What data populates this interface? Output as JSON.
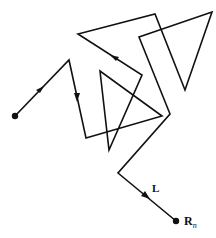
{
  "diagram": {
    "stroke_color": "#111111",
    "labels": {
      "segment_label": "L",
      "end_label": "R",
      "end_subscript": "n"
    },
    "path_points": [
      [
        15,
        116
      ],
      [
        69,
        60
      ],
      [
        86,
        138
      ],
      [
        162,
        116
      ],
      [
        100,
        71
      ],
      [
        109,
        150
      ],
      [
        142,
        75
      ],
      [
        78,
        34
      ],
      [
        155,
        14
      ],
      [
        185,
        90
      ],
      [
        212,
        12
      ],
      [
        139,
        37
      ],
      [
        170,
        114
      ],
      [
        118,
        173
      ],
      [
        176,
        221
      ]
    ],
    "arrows": [
      {
        "at": [
          41,
          89
        ],
        "direction": "up-right"
      },
      {
        "at": [
          77,
          97
        ],
        "direction": "down"
      },
      {
        "at": [
          114,
          57
        ],
        "direction": "up-left"
      },
      {
        "at": [
          146,
          196
        ],
        "direction": "down-right"
      }
    ],
    "endpoints": {
      "start": [
        15,
        116
      ],
      "end": [
        176,
        221
      ]
    }
  }
}
